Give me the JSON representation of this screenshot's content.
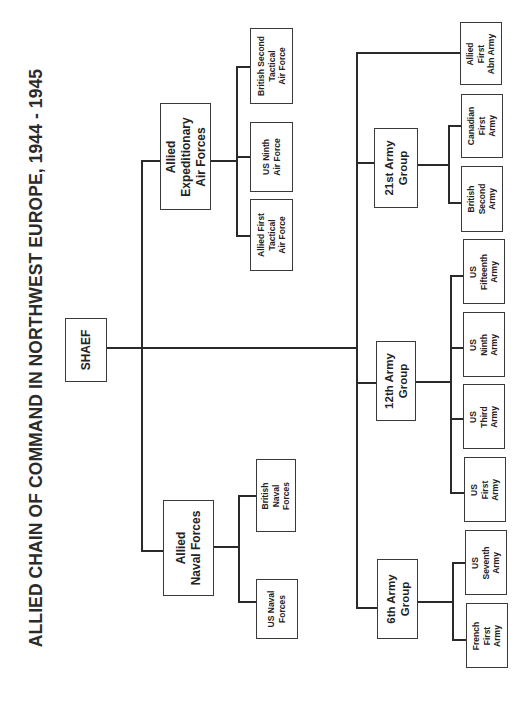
{
  "title": "ALLIED CHAIN OF COMMAND IN NORTHWEST EUROPE, 1944 - 1945",
  "orientation": "rotated 90 degrees counter-clockwise",
  "root": {
    "label": "SHAEF"
  },
  "air": {
    "label": "Allied\nExpeditionary\nAir Forces",
    "children": [
      {
        "label": "Allied First\nTactical\nAir Force"
      },
      {
        "label": "US Ninth\nAir Force"
      },
      {
        "label": "British Second\nTactical\nAir Force"
      }
    ]
  },
  "naval": {
    "label": "Allied\nNaval Forces",
    "children": [
      {
        "label": "British\nNaval\nForces"
      },
      {
        "label": "US Naval\nForces"
      }
    ]
  },
  "army_groups": [
    {
      "label": "21st Army\nGroup",
      "children": [
        {
          "label": "British\nSecond\nArmy"
        },
        {
          "label": "Canadian\nFirst\nArmy"
        }
      ]
    },
    {
      "label": "12th Army\nGroup",
      "children": [
        {
          "label": "US\nFirst\nArmy"
        },
        {
          "label": "US\nThird\nArmy"
        },
        {
          "label": "US\nNinth\nArmy"
        },
        {
          "label": "US\nFifteenth\nArmy"
        }
      ]
    },
    {
      "label": "6th Army\nGroup",
      "children": [
        {
          "label": "French\nFirst\nArmy"
        },
        {
          "label": "US\nSeventh\nArmy"
        }
      ]
    }
  ],
  "independent": {
    "label": "Allied\nFirst\nAbn Army"
  },
  "colors": {
    "line": "#2a2a2a",
    "border": "#3a3a3a",
    "text": "#222222",
    "background": "#ffffff"
  }
}
